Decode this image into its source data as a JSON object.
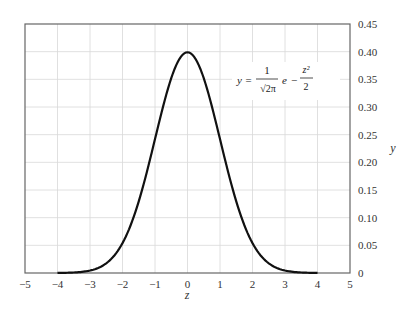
{
  "chart_data": {
    "type": "line",
    "title": "",
    "xlabel": "z",
    "ylabel": "y",
    "xlim": [
      -5,
      5
    ],
    "ylim": [
      0,
      0.45
    ],
    "grid": true,
    "y_axis_position": "right",
    "x_ticks": [
      "-5",
      "-4",
      "-3",
      "-2",
      "-1",
      "0",
      "1",
      "2",
      "3",
      "4",
      "5"
    ],
    "y_ticks": [
      "0",
      "0.05",
      "0.10",
      "0.15",
      "0.20",
      "0.25",
      "0.30",
      "0.35",
      "0.40",
      "0.45"
    ],
    "annotation": "y = 1/√(2π) · e^(−z²/2)",
    "series": [
      {
        "name": "Standard normal density",
        "x": [
          -4,
          -3.5,
          -3,
          -2.5,
          -2,
          -1.5,
          -1,
          -0.5,
          0,
          0.5,
          1,
          1.5,
          2,
          2.5,
          3,
          3.5,
          4
        ],
        "values": [
          0.0001,
          0.0009,
          0.0044,
          0.0175,
          0.054,
          0.1295,
          0.242,
          0.3521,
          0.3989,
          0.3521,
          0.242,
          0.1295,
          0.054,
          0.0175,
          0.0044,
          0.0009,
          0.0001
        ]
      }
    ]
  },
  "labels": {
    "xlabel": "z",
    "ylabel": "y",
    "eq_lhs": "y =",
    "eq_num": "1",
    "eq_den": "√2π",
    "eq_e": "e",
    "eq_minus": "−",
    "eq_exp_num": "z²",
    "eq_exp_den": "2"
  }
}
